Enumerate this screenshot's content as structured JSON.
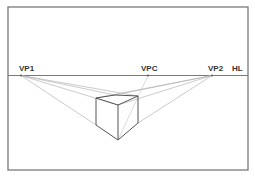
{
  "diagram": {
    "labels": {
      "vp1": "VP1",
      "vpc": "VPC",
      "vp2": "VP2",
      "hl": "HL"
    },
    "colors": {
      "frame": "#6e6e6e",
      "horizon": "#7a7a7a",
      "guide": "#b5b5b5",
      "cube": "#555555",
      "text": "#333333"
    }
  }
}
